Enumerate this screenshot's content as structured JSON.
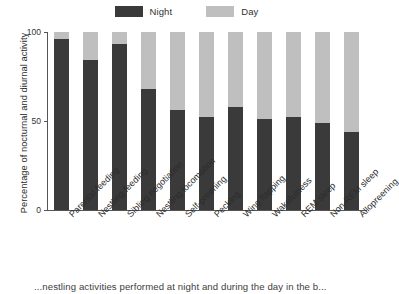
{
  "legend": {
    "position": "top-center",
    "entries": [
      {
        "label": "Night",
        "color": "#3a3a3a",
        "icon": "legend-swatch-night"
      },
      {
        "label": "Day",
        "color": "#bfbfbf",
        "icon": "legend-swatch-day"
      }
    ]
  },
  "axes": {
    "ylabel": "Percentage of nocturnal and diurnal activity",
    "yticks": [
      "0",
      "50",
      "100"
    ],
    "ymin": 0,
    "ymax": 100
  },
  "caption": {
    "text": "...nestling activities performed at night and during the day in the b..."
  },
  "colors": {
    "night": "#3a3a3a",
    "day": "#bfbfbf",
    "axis": "#555555",
    "text": "#2b2b2b",
    "background": "#ffffff"
  },
  "chart_data": {
    "type": "bar",
    "subtype": "stacked-percentage",
    "title": "",
    "xlabel": "",
    "ylabel": "Percentage of nocturnal and diurnal activity",
    "ylim": [
      0,
      100
    ],
    "yticks": [
      0,
      50,
      100
    ],
    "grid": false,
    "legend_position": "top-center",
    "categories": [
      "Parental feeding",
      "Nestling feeding",
      "Sibling negotiation",
      "Nestling locomotion",
      "Self-preening",
      "Pecking",
      "Wing flapping",
      "Wakefulness",
      "REM sleep",
      "Non-REM sleep",
      "Allopreening"
    ],
    "series": [
      {
        "name": "Night",
        "color": "#3a3a3a",
        "values": [
          96,
          84,
          93,
          68,
          56,
          52,
          58,
          51,
          52,
          49,
          44
        ]
      },
      {
        "name": "Day",
        "color": "#bfbfbf",
        "values": [
          4,
          16,
          7,
          32,
          44,
          48,
          42,
          49,
          48,
          51,
          56
        ]
      }
    ]
  }
}
